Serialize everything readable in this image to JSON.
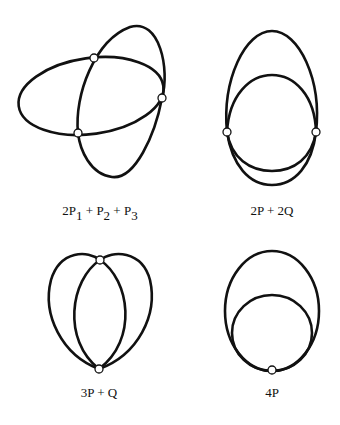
{
  "figures": [
    {
      "id": "fig1",
      "label_main": "2P",
      "label_parts": [
        {
          "text": "2P",
          "sub": "1"
        },
        {
          "text": " + P",
          "sub": "2"
        },
        {
          "text": " + P",
          "sub": "3"
        }
      ],
      "label_text": "2P1 + P2 + P3",
      "points": [
        [
          94,
          58
        ],
        [
          162,
          98
        ],
        [
          78,
          133
        ]
      ]
    },
    {
      "id": "fig2",
      "label_text": "2P + 2Q",
      "points": [
        [
          227,
          132
        ],
        [
          316,
          132
        ]
      ]
    },
    {
      "id": "fig3",
      "label_text": "3P + Q",
      "points": [
        [
          100,
          260
        ],
        [
          99,
          369
        ]
      ]
    },
    {
      "id": "fig4",
      "label_text": "4P",
      "points": [
        [
          272,
          370
        ]
      ]
    }
  ],
  "colors": {
    "stroke": "#111111",
    "background": "#ffffff"
  }
}
